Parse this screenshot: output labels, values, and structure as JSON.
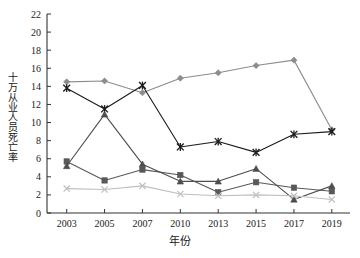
{
  "chart_data": {
    "type": "line",
    "title": "",
    "xlabel": "年份",
    "ylabel": "十万从业人员死亡率",
    "categories": [
      "2003",
      "2005",
      "2007",
      "2010",
      "2013",
      "2015",
      "2017",
      "2019"
    ],
    "ylim": [
      0,
      22
    ],
    "ytick_step": 2,
    "yticks": [
      "0",
      "2",
      "4",
      "6",
      "8",
      "10",
      "12",
      "14",
      "16",
      "18",
      "20",
      "22"
    ],
    "grid": false,
    "legend": "none",
    "series": [
      {
        "name": "series-diamond",
        "marker": "diamond",
        "color": "#8c8c8c",
        "values": [
          14.5,
          14.6,
          13.3,
          14.9,
          15.5,
          16.3,
          16.9,
          9.2
        ]
      },
      {
        "name": "series-asterisk",
        "marker": "asterisk",
        "color": "#1a1a1a",
        "values": [
          13.8,
          11.5,
          14.1,
          7.3,
          7.9,
          6.7,
          8.7,
          9.0
        ]
      },
      {
        "name": "series-square",
        "marker": "square",
        "color": "#595959",
        "values": [
          5.7,
          3.6,
          4.8,
          4.2,
          2.3,
          3.4,
          2.8,
          2.4
        ]
      },
      {
        "name": "series-triangle",
        "marker": "triangle",
        "color": "#4d4d4d",
        "values": [
          5.2,
          10.9,
          5.4,
          3.5,
          3.5,
          4.9,
          1.5,
          3.0
        ]
      },
      {
        "name": "series-cross",
        "marker": "cross",
        "color": "#bfbfbf",
        "values": [
          2.7,
          2.6,
          3.0,
          2.1,
          1.9,
          2.0,
          1.9,
          1.5
        ]
      }
    ]
  }
}
